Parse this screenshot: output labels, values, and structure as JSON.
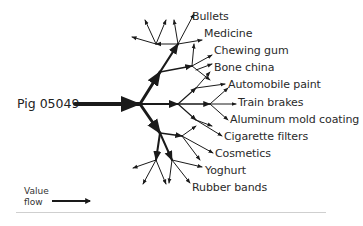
{
  "root": {
    "label": "Pig 05049"
  },
  "products": [
    "Bullets",
    "Medicine",
    "Chewing gum",
    "Bone china",
    "Automobile paint",
    "Train brakes",
    "Aluminum mold coating",
    "Cigarette filters",
    "Cosmetics",
    "Yoghurt",
    "Rubber bands"
  ],
  "legend": {
    "line1": "Value",
    "line2": "flow"
  },
  "colors": {
    "ink": "#1a1a1a",
    "text": "#2a2a2a",
    "divider": "#cfcfcf"
  }
}
